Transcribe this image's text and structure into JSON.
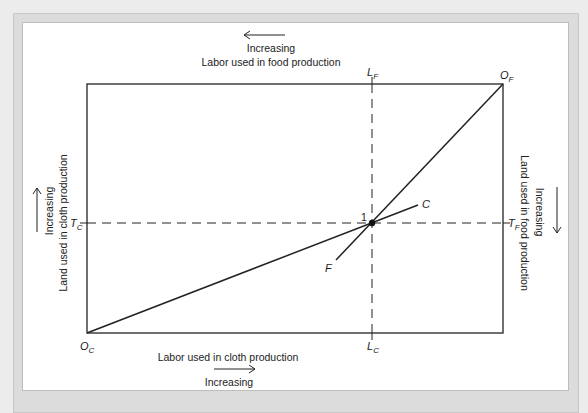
{
  "diagram": {
    "type": "edgeworth-box",
    "top_axis": {
      "direction_label": "Increasing",
      "label": "Labor used in food production",
      "arrow": "left"
    },
    "bottom_axis": {
      "label": "Labor used in cloth production",
      "direction_label": "Increasing",
      "arrow": "right"
    },
    "left_axis": {
      "direction_label": "Increasing",
      "label": "Land used in cloth production",
      "arrow": "up"
    },
    "right_axis": {
      "direction_label": "Increasing",
      "label": "Land used in food production",
      "arrow": "down"
    },
    "origins": {
      "cloth": {
        "main": "O",
        "sub": "C"
      },
      "food": {
        "main": "O",
        "sub": "F"
      }
    },
    "markers": {
      "LF": {
        "main": "L",
        "sub": "F"
      },
      "LC": {
        "main": "L",
        "sub": "C"
      },
      "TC": {
        "main": "T",
        "sub": "C"
      },
      "TF": {
        "main": "T",
        "sub": "F"
      }
    },
    "curves": {
      "C": "C",
      "F": "F"
    },
    "point": "1"
  }
}
